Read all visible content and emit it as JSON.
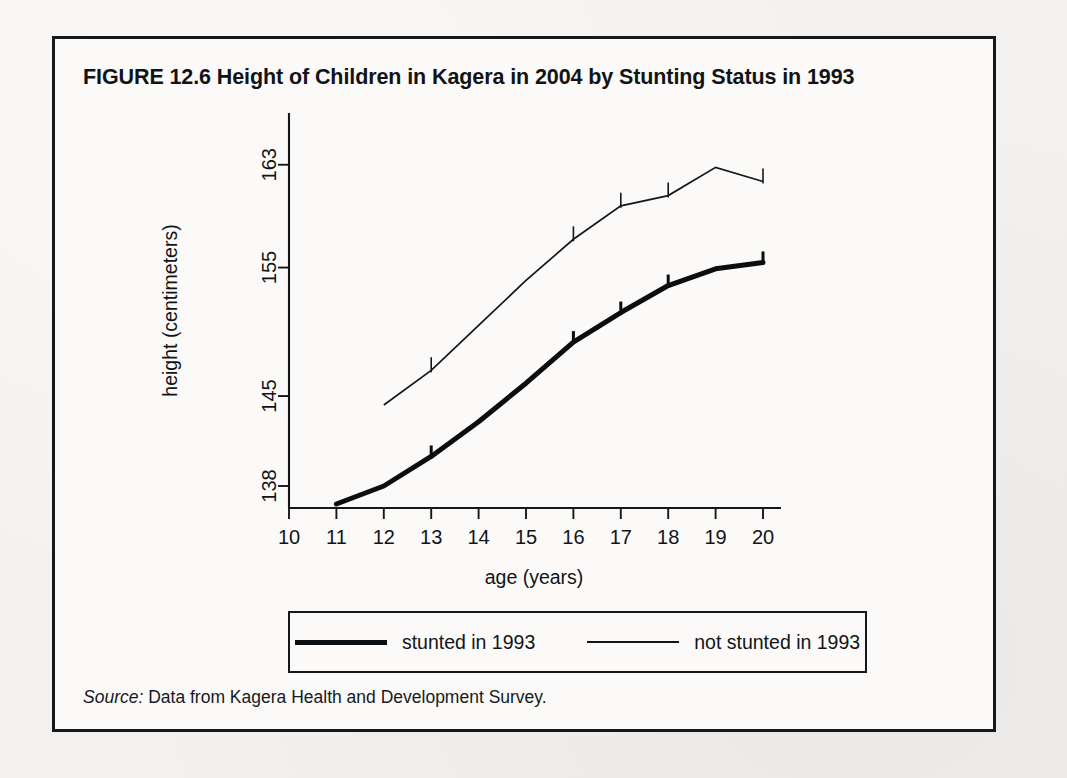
{
  "figure": {
    "title": "FIGURE 12.6  Height of Children in Kagera in 2004 by Stunting Status in 1993",
    "source_prefix": "Source:",
    "source_text": " Data from Kagera Health and Development Survey."
  },
  "legend": {
    "position": "below-plot",
    "entries": [
      {
        "label": "stunted in 1993",
        "style": "thick-line",
        "color": "#0b0e11"
      },
      {
        "label": "not stunted in 1993",
        "style": "thin-line",
        "color": "#14171a"
      }
    ]
  },
  "chart_data": {
    "type": "line",
    "title": "Height of Children in Kagera in 2004 by Stunting Status in 1993",
    "xlabel": "age (years)",
    "ylabel": "height (centimeters)",
    "xlim": [
      10,
      20
    ],
    "ylim": [
      134,
      165
    ],
    "grid": false,
    "xticks": [
      10,
      11,
      12,
      13,
      14,
      15,
      16,
      17,
      18,
      19,
      20
    ],
    "xtick_labels": [
      "10",
      "11",
      "12",
      "13",
      "14",
      "15",
      "16",
      "17",
      "18",
      "19",
      "20"
    ],
    "yticks": [
      138,
      145,
      155,
      163
    ],
    "ytick_labels": [
      "138",
      "145",
      "155",
      "163"
    ],
    "legend_position": "below",
    "series": [
      {
        "name": "stunted in 1993",
        "style": "thick-line",
        "color": "#0b0e11",
        "x": [
          11,
          12,
          13,
          14,
          15,
          16,
          17,
          18,
          19,
          20
        ],
        "values": [
          136.6,
          138.0,
          140.3,
          143.0,
          146.0,
          149.2,
          151.5,
          153.6,
          154.9,
          155.4
        ],
        "whisker_ages": [
          13,
          16,
          17,
          18,
          20
        ]
      },
      {
        "name": "not stunted in 1993",
        "style": "thin-line",
        "color": "#14171a",
        "x": [
          12,
          13,
          14,
          15,
          16,
          17,
          18,
          19,
          20
        ],
        "values": [
          144.3,
          147.0,
          150.5,
          154.0,
          157.2,
          159.8,
          160.6,
          162.8,
          161.7
        ],
        "whisker_ages": [
          13,
          16,
          17,
          18,
          20
        ]
      }
    ]
  }
}
